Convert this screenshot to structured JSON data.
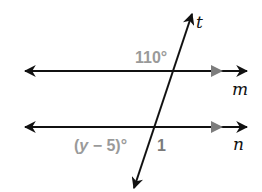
{
  "diagram": {
    "type": "parallel-lines-transversal",
    "lines": {
      "m": {
        "label": "m"
      },
      "n": {
        "label": "n"
      },
      "t": {
        "label": "t"
      }
    },
    "angles": {
      "top_angle": {
        "label": "110°"
      },
      "bottom_angle_expr": {
        "label_prefix": "(",
        "variable": "y",
        "label_suffix": " − 5)°"
      },
      "angle_1": {
        "label": "1"
      }
    },
    "colors": {
      "line": "#111111",
      "annotation_gray": "#9a9a9a",
      "parallel_marker": "#7d7d7d"
    }
  }
}
